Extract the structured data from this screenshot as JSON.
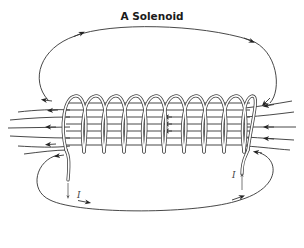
{
  "diagram": {
    "title": "A Solenoid",
    "coil": {
      "turns": 10
    },
    "current_labels": {
      "left": "I",
      "right": "I"
    },
    "colors": {
      "line": "#333333",
      "background": "#ffffff"
    }
  }
}
